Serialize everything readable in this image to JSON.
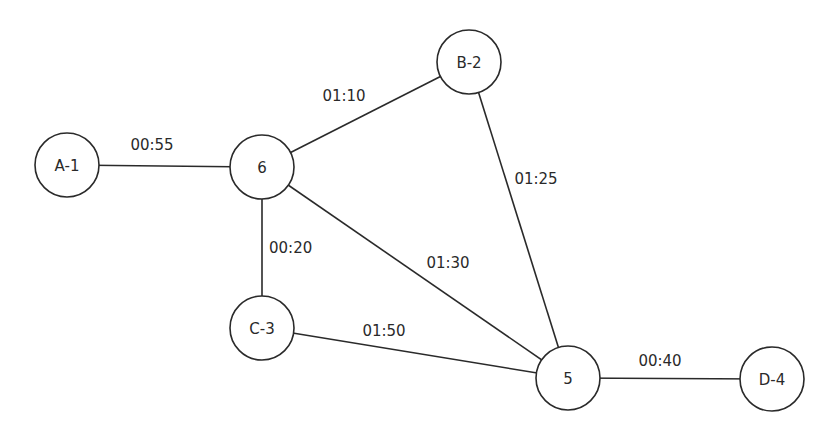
{
  "diagram": {
    "type": "weighted-graph",
    "node_radius": 32,
    "nodes": [
      {
        "id": "A-1",
        "label": "A-1",
        "x": 67,
        "y": 165
      },
      {
        "id": "6",
        "label": "6",
        "x": 262,
        "y": 167
      },
      {
        "id": "B-2",
        "label": "B-2",
        "x": 469,
        "y": 62
      },
      {
        "id": "C-3",
        "label": "C-3",
        "x": 262,
        "y": 328
      },
      {
        "id": "5",
        "label": "5",
        "x": 568,
        "y": 378
      },
      {
        "id": "D-4",
        "label": "D-4",
        "x": 772,
        "y": 379
      }
    ],
    "edges": [
      {
        "from": "A-1",
        "to": "6",
        "label": "00:55",
        "lx": 152,
        "ly": 145,
        "anchor": "middle"
      },
      {
        "from": "6",
        "to": "B-2",
        "label": "01:10",
        "lx": 344,
        "ly": 96,
        "anchor": "middle"
      },
      {
        "from": "B-2",
        "to": "5",
        "label": "01:25",
        "lx": 536,
        "ly": 179,
        "anchor": "middle"
      },
      {
        "from": "6",
        "to": "C-3",
        "label": "00:20",
        "lx": 269,
        "ly": 248,
        "anchor": "start"
      },
      {
        "from": "6",
        "to": "5",
        "label": "01:30",
        "lx": 448,
        "ly": 263,
        "anchor": "middle"
      },
      {
        "from": "C-3",
        "to": "5",
        "label": "01:50",
        "lx": 384,
        "ly": 331,
        "anchor": "middle"
      },
      {
        "from": "5",
        "to": "D-4",
        "label": "00:40",
        "lx": 660,
        "ly": 361,
        "anchor": "middle"
      }
    ]
  }
}
